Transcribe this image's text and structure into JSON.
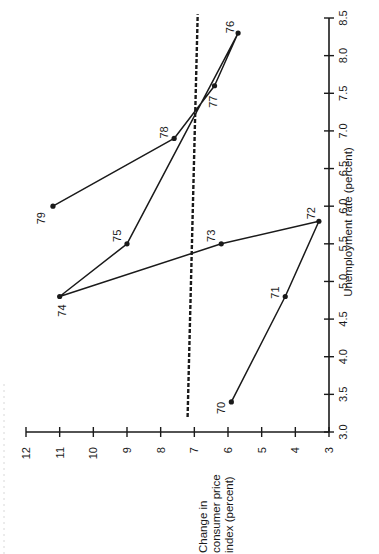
{
  "chart_data": {
    "type": "line",
    "orientation": "rotated 90° counter-clockwise (x-axis drawn vertically on the right, y-axis drawn horizontally at the bottom)",
    "title": "",
    "xlabel": "Unemployment rate (percent)",
    "ylabel": "Change in consumer price index (percent)",
    "ylabel_lines": [
      "Change in",
      "consumer price",
      "index (percent)"
    ],
    "xlim": [
      3.0,
      8.5
    ],
    "ylim": [
      3,
      12
    ],
    "x_ticks": [
      "3.0",
      "3.5",
      "4.0",
      "4.5",
      "5.0",
      "5.5",
      "6.0",
      "6.5",
      "7.0",
      "7.5",
      "8.0",
      "8.5"
    ],
    "y_ticks": [
      "3",
      "4",
      "5",
      "6",
      "7",
      "8",
      "9",
      "10",
      "11",
      "12"
    ],
    "grid": false,
    "legend": null,
    "series": [
      {
        "name": "Inflation vs. unemployment, 1970–1979",
        "style": "solid line with dot markers",
        "points": [
          {
            "label": "70",
            "x": 3.4,
            "y": 5.9
          },
          {
            "label": "71",
            "x": 4.8,
            "y": 4.3
          },
          {
            "label": "72",
            "x": 5.8,
            "y": 3.3
          },
          {
            "label": "73",
            "x": 5.5,
            "y": 6.2
          },
          {
            "label": "74",
            "x": 4.8,
            "y": 11.0
          },
          {
            "label": "75",
            "x": 5.5,
            "y": 9.0
          },
          {
            "label": "76",
            "x": 8.3,
            "y": 5.7
          },
          {
            "label": "77",
            "x": 7.6,
            "y": 6.4
          },
          {
            "label": "78",
            "x": 6.9,
            "y": 7.6
          },
          {
            "label": "79",
            "x": 6.0,
            "y": 11.2
          }
        ]
      },
      {
        "name": "Trend line",
        "style": "dashed",
        "points": [
          {
            "x": 3.2,
            "y": 7.2
          },
          {
            "x": 8.55,
            "y": 6.9
          }
        ]
      }
    ]
  },
  "edge_text": "cut-off caption text at page edge (illegible)"
}
